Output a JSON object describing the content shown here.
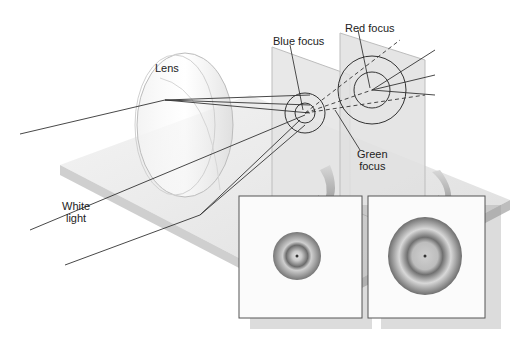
{
  "diagram": {
    "type": "optics-chromatic-aberration",
    "labels": {
      "lens": "Lens",
      "white_light": [
        "White",
        "light"
      ],
      "blue_focus": "Blue focus",
      "red_focus": "Red focus",
      "green_focus": [
        "Green",
        "focus"
      ]
    },
    "insets": [
      {
        "name": "blue-focus-screen-image",
        "rings": [
          "#7a7a7a",
          "#bdbdbd",
          "#6f6f6f",
          "#e0e0e0"
        ]
      },
      {
        "name": "red-focus-screen-image",
        "rings": [
          "#6e6e6e",
          "#c8c8c8",
          "#6a6a6a",
          "#dedede"
        ]
      }
    ],
    "colors": {
      "background": "#ffffff",
      "platform_top": "#e8e8e8",
      "platform_side": "#c9c9c9",
      "screen": "#e3e3e3",
      "ray": "#333333",
      "arrow": "#8f8f8f"
    }
  }
}
